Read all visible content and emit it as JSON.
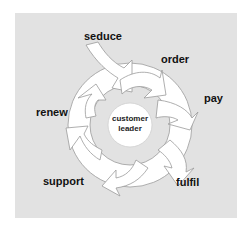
{
  "diagram": {
    "type": "cycle",
    "center": {
      "line1": "customer",
      "line2": "leader"
    },
    "stages": [
      {
        "label": "seduce"
      },
      {
        "label": "order"
      },
      {
        "label": "pay"
      },
      {
        "label": "fulfil"
      },
      {
        "label": "support"
      },
      {
        "label": "renew"
      }
    ],
    "colors": {
      "background": "#e2e2e2",
      "arrow_fill": "#ffffff",
      "arrow_stroke": "#9a9a9a",
      "text": "#111111"
    }
  }
}
